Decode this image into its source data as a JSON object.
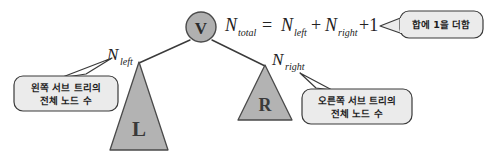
{
  "diagram": {
    "colors": {
      "node_fill": "#b0b0b0",
      "triangle_fill": "#b3b3b3",
      "callout_fill": "#ebebeb",
      "stroke": "#3a3a3a",
      "text": "#222222",
      "background": "#ffffff"
    },
    "root_node": {
      "label": "V"
    },
    "subtrees": [
      {
        "name": "left-subtree",
        "label": "L"
      },
      {
        "name": "right-subtree",
        "label": "R"
      }
    ],
    "edge_labels": [
      {
        "name": "n-left-label",
        "base": "N",
        "sub": "left"
      },
      {
        "name": "n-right-label",
        "base": "N",
        "sub": "right"
      }
    ],
    "formula": {
      "lhs_base": "N",
      "lhs_sub": "total",
      "equals": "=",
      "term1_base": "N",
      "term1_sub": "left",
      "plus1": "+",
      "term2_base": "N",
      "term2_sub": "right",
      "plus2": "+1",
      "full_text": "N_total = N_left + N_right + 1"
    },
    "callouts": [
      {
        "name": "callout-left-subtree",
        "lines": [
          "왼쪽 서브 트리의",
          "전체 노드 수"
        ]
      },
      {
        "name": "callout-right-subtree",
        "lines": [
          "오른쪽 서브 트리의",
          "전체 노드 수"
        ]
      },
      {
        "name": "callout-plus-one",
        "lines": [
          "합에 1을 더함"
        ]
      }
    ]
  }
}
